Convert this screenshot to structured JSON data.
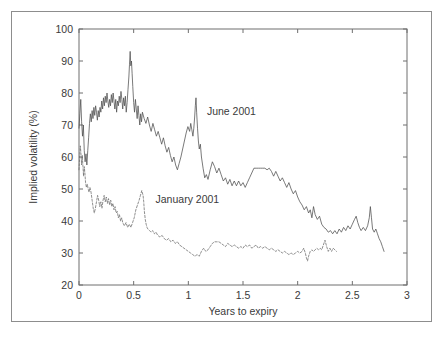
{
  "figure": {
    "background_color": "#ffffff",
    "frame_color": "#8d8d8d"
  },
  "chart_data": {
    "type": "line",
    "title": "",
    "xlabel": "Years to expiry",
    "ylabel": "Implied volatility (%)",
    "xlim": [
      0,
      3
    ],
    "ylim": [
      20,
      100
    ],
    "xticks": [
      0,
      0.5,
      1,
      1.5,
      2,
      2.5,
      3
    ],
    "xticklabels": [
      "0",
      "0.5",
      "1",
      "1.5",
      "2",
      "2.5",
      "3"
    ],
    "yticks": [
      20,
      30,
      40,
      50,
      60,
      70,
      80,
      90,
      100
    ],
    "yticklabels": [
      "20",
      "30",
      "40",
      "50",
      "60",
      "70",
      "80",
      "90",
      "100"
    ],
    "grid": false,
    "legend_position": "inline-annotation",
    "annotations": [
      {
        "text": "June 2001",
        "x": 1.17,
        "y": 73.0
      },
      {
        "text": "January 2001",
        "x": 0.7,
        "y": 45.5
      }
    ],
    "series": [
      {
        "name": "June 2001",
        "style": "solid",
        "color": "#4d4d4d",
        "x": [
          0.0,
          0.008,
          0.016,
          0.024,
          0.032,
          0.04,
          0.048,
          0.056,
          0.064,
          0.072,
          0.08,
          0.088,
          0.096,
          0.104,
          0.112,
          0.12,
          0.128,
          0.136,
          0.144,
          0.152,
          0.16,
          0.168,
          0.176,
          0.184,
          0.192,
          0.2,
          0.208,
          0.216,
          0.224,
          0.232,
          0.24,
          0.248,
          0.256,
          0.264,
          0.272,
          0.28,
          0.288,
          0.296,
          0.304,
          0.312,
          0.32,
          0.328,
          0.336,
          0.344,
          0.352,
          0.36,
          0.368,
          0.376,
          0.384,
          0.392,
          0.4,
          0.408,
          0.416,
          0.424,
          0.432,
          0.44,
          0.448,
          0.456,
          0.462,
          0.468,
          0.474,
          0.48,
          0.486,
          0.492,
          0.5,
          0.508,
          0.516,
          0.524,
          0.532,
          0.54,
          0.548,
          0.556,
          0.564,
          0.572,
          0.58,
          0.596,
          0.612,
          0.628,
          0.644,
          0.66,
          0.676,
          0.692,
          0.708,
          0.724,
          0.74,
          0.756,
          0.772,
          0.788,
          0.804,
          0.82,
          0.836,
          0.852,
          0.868,
          0.884,
          0.9,
          0.916,
          0.932,
          0.948,
          0.964,
          0.98,
          0.996,
          1.012,
          1.022,
          1.032,
          1.042,
          1.05,
          1.058,
          1.064,
          1.07,
          1.076,
          1.084,
          1.092,
          1.1,
          1.11,
          1.12,
          1.135,
          1.15,
          1.165,
          1.18,
          1.2,
          1.22,
          1.24,
          1.26,
          1.28,
          1.3,
          1.32,
          1.34,
          1.36,
          1.38,
          1.4,
          1.42,
          1.44,
          1.46,
          1.48,
          1.5,
          1.52,
          1.54,
          1.56,
          1.58,
          1.6,
          1.62,
          1.64,
          1.66,
          1.68,
          1.7,
          1.72,
          1.74,
          1.76,
          1.78,
          1.8,
          1.82,
          1.84,
          1.86,
          1.88,
          1.9,
          1.92,
          1.94,
          1.96,
          1.98,
          2.0,
          2.02,
          2.04,
          2.06,
          2.08,
          2.1,
          2.115,
          2.13,
          2.145,
          2.16,
          2.18,
          2.2,
          2.22,
          2.24,
          2.26,
          2.28,
          2.3,
          2.32,
          2.34,
          2.36,
          2.38,
          2.4,
          2.42,
          2.44,
          2.46,
          2.48,
          2.5,
          2.52,
          2.535,
          2.55,
          2.565,
          2.58,
          2.6,
          2.62,
          2.64,
          2.655,
          2.665,
          2.675,
          2.685,
          2.7,
          2.715,
          2.73,
          2.745,
          2.76,
          2.775,
          2.79
        ],
        "y": [
          69.0,
          73.5,
          78.0,
          71.0,
          66.5,
          70.0,
          62.0,
          58.5,
          61.0,
          57.5,
          62.0,
          66.0,
          70.5,
          73.5,
          71.0,
          74.5,
          72.0,
          75.5,
          73.0,
          76.0,
          74.0,
          71.5,
          74.5,
          72.5,
          75.5,
          74.0,
          77.5,
          75.0,
          78.5,
          76.0,
          79.0,
          77.0,
          80.0,
          77.5,
          75.5,
          78.0,
          76.0,
          79.5,
          77.0,
          80.0,
          77.5,
          75.0,
          78.0,
          74.0,
          77.5,
          76.0,
          79.0,
          77.0,
          80.5,
          78.0,
          75.0,
          78.5,
          76.0,
          79.0,
          74.0,
          77.0,
          81.0,
          85.0,
          89.0,
          93.0,
          88.5,
          90.0,
          86.0,
          82.0,
          77.0,
          74.0,
          78.0,
          75.0,
          72.0,
          76.0,
          73.0,
          70.0,
          73.5,
          71.0,
          74.0,
          72.0,
          70.5,
          72.5,
          70.0,
          68.0,
          70.5,
          68.5,
          66.5,
          68.0,
          66.0,
          64.0,
          66.0,
          63.5,
          61.5,
          63.0,
          60.5,
          58.5,
          60.0,
          57.5,
          56.0,
          58.0,
          60.0,
          62.5,
          65.0,
          67.5,
          69.5,
          68.0,
          70.5,
          68.5,
          66.5,
          69.0,
          72.5,
          76.0,
          78.5,
          74.0,
          69.0,
          65.0,
          62.5,
          64.0,
          60.0,
          56.5,
          53.5,
          54.5,
          53.0,
          56.0,
          58.5,
          57.0,
          55.0,
          56.5,
          54.5,
          52.5,
          53.5,
          51.5,
          53.0,
          51.0,
          52.5,
          51.0,
          52.5,
          51.0,
          52.0,
          50.5,
          52.0,
          53.5,
          55.0,
          56.5,
          56.5,
          56.5,
          56.5,
          56.5,
          56.5,
          56.0,
          56.5,
          55.5,
          54.0,
          55.5,
          54.0,
          52.5,
          53.5,
          52.0,
          50.5,
          52.0,
          50.0,
          48.5,
          49.5,
          47.5,
          46.0,
          45.0,
          43.5,
          44.5,
          42.5,
          43.5,
          41.0,
          44.5,
          42.0,
          40.5,
          41.5,
          39.0,
          38.0,
          37.5,
          36.5,
          37.0,
          36.0,
          37.0,
          36.0,
          37.5,
          36.5,
          38.0,
          37.0,
          38.5,
          37.5,
          39.0,
          40.5,
          41.5,
          39.5,
          38.0,
          37.0,
          38.0,
          37.0,
          38.5,
          41.0,
          44.5,
          41.0,
          37.5,
          36.5,
          37.5,
          36.0,
          34.5,
          33.5,
          32.0,
          30.5
        ]
      },
      {
        "name": "January 2001",
        "style": "dashed",
        "color": "#6a6a6a",
        "x": [
          0.0,
          0.006,
          0.012,
          0.018,
          0.024,
          0.03,
          0.036,
          0.042,
          0.048,
          0.054,
          0.06,
          0.068,
          0.076,
          0.084,
          0.092,
          0.1,
          0.11,
          0.12,
          0.13,
          0.14,
          0.15,
          0.16,
          0.17,
          0.18,
          0.19,
          0.2,
          0.21,
          0.22,
          0.23,
          0.24,
          0.25,
          0.26,
          0.27,
          0.28,
          0.29,
          0.3,
          0.31,
          0.32,
          0.33,
          0.34,
          0.35,
          0.36,
          0.37,
          0.38,
          0.39,
          0.4,
          0.415,
          0.43,
          0.445,
          0.46,
          0.475,
          0.49,
          0.505,
          0.52,
          0.535,
          0.55,
          0.562,
          0.574,
          0.586,
          0.592,
          0.598,
          0.606,
          0.614,
          0.622,
          0.63,
          0.645,
          0.66,
          0.675,
          0.69,
          0.705,
          0.72,
          0.74,
          0.76,
          0.78,
          0.8,
          0.82,
          0.84,
          0.86,
          0.88,
          0.9,
          0.92,
          0.94,
          0.96,
          0.98,
          1.0,
          1.02,
          1.04,
          1.06,
          1.08,
          1.1,
          1.12,
          1.14,
          1.16,
          1.18,
          1.2,
          1.22,
          1.24,
          1.26,
          1.28,
          1.3,
          1.32,
          1.34,
          1.36,
          1.38,
          1.4,
          1.42,
          1.44,
          1.46,
          1.48,
          1.5,
          1.52,
          1.54,
          1.56,
          1.58,
          1.6,
          1.62,
          1.64,
          1.66,
          1.68,
          1.7,
          1.72,
          1.74,
          1.76,
          1.78,
          1.8,
          1.82,
          1.84,
          1.86,
          1.88,
          1.9,
          1.92,
          1.94,
          1.96,
          1.98,
          2.0,
          2.02,
          2.04,
          2.055,
          2.07,
          2.08,
          2.09,
          2.1,
          2.115,
          2.13,
          2.145,
          2.16,
          2.175,
          2.19,
          2.205,
          2.22,
          2.235,
          2.25,
          2.265,
          2.28,
          2.295,
          2.31,
          2.325,
          2.34,
          2.355
        ],
        "y": [
          56.0,
          60.0,
          63.5,
          61.0,
          57.5,
          60.5,
          57.0,
          54.0,
          57.0,
          55.0,
          52.0,
          50.5,
          51.5,
          50.0,
          49.0,
          50.5,
          49.0,
          46.5,
          44.0,
          42.5,
          44.0,
          46.0,
          48.0,
          46.5,
          44.5,
          46.0,
          44.0,
          46.5,
          48.0,
          46.0,
          47.5,
          45.5,
          47.0,
          45.0,
          46.5,
          44.5,
          45.5,
          43.5,
          44.5,
          42.5,
          43.0,
          41.0,
          42.0,
          40.0,
          41.0,
          39.5,
          38.5,
          39.5,
          38.0,
          39.0,
          38.0,
          39.5,
          41.0,
          43.5,
          45.0,
          46.5,
          48.0,
          49.5,
          48.0,
          46.0,
          43.0,
          40.5,
          39.0,
          38.0,
          37.5,
          37.0,
          36.5,
          37.0,
          36.0,
          36.5,
          35.5,
          35.0,
          35.5,
          34.5,
          34.0,
          34.5,
          33.5,
          34.0,
          33.0,
          33.5,
          32.5,
          32.0,
          31.5,
          31.0,
          30.5,
          30.0,
          29.5,
          29.0,
          29.5,
          29.0,
          30.5,
          31.5,
          30.5,
          31.0,
          32.0,
          33.0,
          33.5,
          33.5,
          33.5,
          33.0,
          32.5,
          32.0,
          33.0,
          32.5,
          32.0,
          32.5,
          32.0,
          31.5,
          32.0,
          31.5,
          32.5,
          32.0,
          32.5,
          31.5,
          32.0,
          32.5,
          31.5,
          32.0,
          31.5,
          32.0,
          31.5,
          31.0,
          31.5,
          31.0,
          30.5,
          31.0,
          30.5,
          30.0,
          30.5,
          30.0,
          29.5,
          30.0,
          29.5,
          30.0,
          30.5,
          30.0,
          30.5,
          31.5,
          30.0,
          28.5,
          27.5,
          29.0,
          30.5,
          31.0,
          30.5,
          31.0,
          31.5,
          31.0,
          31.5,
          31.0,
          32.5,
          34.0,
          32.0,
          30.5,
          31.5,
          30.5,
          31.5,
          31.0,
          30.5
        ]
      }
    ]
  }
}
